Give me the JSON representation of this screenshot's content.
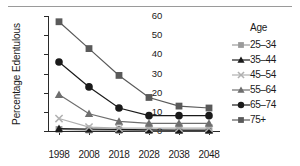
{
  "chart_data": {
    "type": "line",
    "title": "",
    "xlabel": "",
    "ylabel": "Percentage Edentulous",
    "x": [
      1998,
      2008,
      2018,
      2028,
      2038,
      2048
    ],
    "xtick_labels": [
      "1998",
      "2008",
      "2018",
      "2028",
      "2038",
      "2048"
    ],
    "ytick_labels": [
      "0",
      "10",
      "20",
      "30",
      "40",
      "50",
      "60"
    ],
    "yticks": [
      0,
      10,
      20,
      30,
      40,
      50,
      60
    ],
    "ylim": [
      0,
      60
    ],
    "grid": false,
    "legend_position": "right",
    "legend_title": "Age",
    "series": [
      {
        "name": "25–34",
        "marker": "square",
        "color": "#9a9a9a",
        "values": [
          0.8,
          0.5,
          0.3,
          0.2,
          0.2,
          0.2
        ]
      },
      {
        "name": "35–44",
        "marker": "triangle",
        "color": "#1a1a1a",
        "values": [
          1.2,
          1.0,
          0.8,
          0.6,
          0.5,
          0.5
        ]
      },
      {
        "name": "45–54",
        "marker": "x",
        "color": "#b0b0b0",
        "values": [
          6.5,
          2.0,
          1.5,
          1.5,
          1.5,
          1.5
        ]
      },
      {
        "name": "55–64",
        "marker": "triangle",
        "color": "#6e6e6e",
        "values": [
          19.0,
          9.0,
          5.0,
          4.0,
          4.0,
          4.0
        ]
      },
      {
        "name": "65–74",
        "marker": "circle",
        "color": "#1a1a1a",
        "values": [
          36.0,
          23.0,
          12.0,
          8.0,
          8.0,
          8.0
        ]
      },
      {
        "name": "75+",
        "marker": "square",
        "color": "#5a5a5a",
        "values": [
          57.0,
          43.0,
          29.0,
          17.5,
          13.0,
          12.0
        ]
      }
    ]
  },
  "axis": {
    "y_title": "Percentage Edentulous"
  },
  "legend": {
    "title": "Age",
    "items": [
      {
        "label": "25–34"
      },
      {
        "label": "35–44"
      },
      {
        "label": "45–54"
      },
      {
        "label": "55–64"
      },
      {
        "label": "65–74"
      },
      {
        "label": "75+"
      }
    ]
  }
}
